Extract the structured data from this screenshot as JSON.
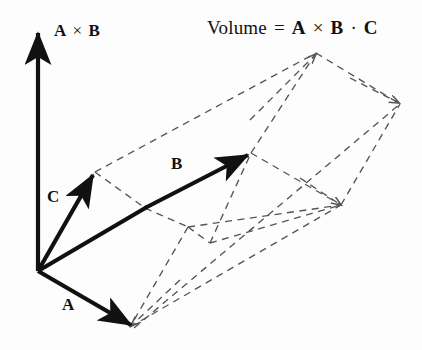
{
  "figure": {
    "title": {
      "prefix": "Volume",
      "equals": "=",
      "vector_a": "A",
      "cross": "×",
      "vector_b": "B",
      "dot": "·",
      "vector_c": "C",
      "full_text": "Volume = A × B · C"
    },
    "labels": {
      "cross_product_vec_a": "A",
      "cross_product_op": "×",
      "cross_product_vec_b": "B",
      "cross_product_full": "A × B",
      "vector_a": "A",
      "vector_b": "B",
      "vector_c": "C"
    },
    "colors": {
      "ink": "#111111",
      "dashed": "#555555",
      "background": "#fdfdfd"
    },
    "geometry": {
      "origin": [
        38,
        271
      ],
      "solid_vectors": [
        {
          "name": "A × B",
          "from": [
            38,
            271
          ],
          "to": [
            38,
            28
          ]
        },
        {
          "name": "C",
          "from": [
            38,
            271
          ],
          "to": [
            95,
            172
          ]
        },
        {
          "name": "B",
          "from": [
            145,
            208
          ],
          "to": [
            251,
            153
          ]
        },
        {
          "name": "A",
          "from": [
            38,
            271
          ],
          "to": [
            134,
            328
          ]
        },
        {
          "name": "edge-origin-to-B-base",
          "from": [
            38,
            271
          ],
          "to": [
            145,
            208
          ]
        }
      ],
      "dashed_edges": [
        [
          [
            95,
            172
          ],
          [
            316,
            53
          ]
        ],
        [
          [
            95,
            172
          ],
          [
            145,
            208
          ]
        ],
        [
          [
            145,
            208
          ],
          [
            188,
            227
          ]
        ],
        [
          [
            188,
            227
          ],
          [
            341,
            205
          ]
        ],
        [
          [
            251,
            153
          ],
          [
            316,
            53
          ]
        ],
        [
          [
            251,
            153
          ],
          [
            341,
            205
          ]
        ],
        [
          [
            316,
            53
          ],
          [
            400,
            104
          ]
        ],
        [
          [
            341,
            205
          ],
          [
            400,
            104
          ]
        ],
        [
          [
            188,
            227
          ],
          [
            130,
            327
          ]
        ],
        [
          [
            130,
            327
          ],
          [
            341,
            205
          ]
        ],
        [
          [
            134,
            328
          ],
          [
            400,
            104
          ]
        ],
        [
          [
            188,
            227
          ],
          [
            210,
            243
          ]
        ],
        [
          [
            210,
            243
          ],
          [
            251,
            153
          ]
        ],
        [
          [
            210,
            243
          ],
          [
            341,
            205
          ]
        ]
      ]
    }
  }
}
